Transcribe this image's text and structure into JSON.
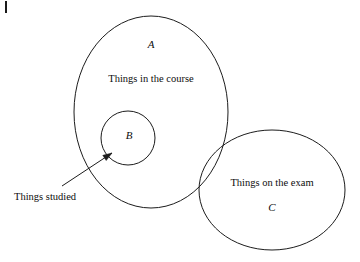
{
  "diagram": {
    "type": "euler-venn",
    "background_color": "#ffffff",
    "stroke_color": "#1c1c1c",
    "text_color": "#0d0d0d",
    "corner_mark": {
      "name": "crop-tick-mark",
      "x": 6,
      "y1": 1,
      "y2": 13
    },
    "sets": [
      {
        "key": "A",
        "symbol": "A",
        "description": "Things in the course",
        "shape": "ellipse",
        "cx": 151,
        "cy": 112,
        "rx": 77,
        "ry": 96,
        "symbol_x": 151,
        "symbol_y": 45,
        "description_x": 151,
        "description_y": 80
      },
      {
        "key": "B",
        "symbol": "B",
        "description": "",
        "shape": "circle",
        "cx": 128,
        "cy": 138,
        "rx": 27,
        "ry": 27,
        "symbol_x": 129,
        "symbol_y": 136,
        "description_x": 0,
        "description_y": 0
      },
      {
        "key": "C",
        "symbol": "C",
        "description": "Things on the exam",
        "shape": "ellipse",
        "cx": 272,
        "cy": 190,
        "rx": 73,
        "ry": 60,
        "symbol_x": 272,
        "symbol_y": 208,
        "description_x": 272,
        "description_y": 184
      }
    ],
    "annotation": {
      "label": "Things studied",
      "label_x": 14,
      "label_y": 198,
      "arrow_from_x": 62,
      "arrow_from_y": 186,
      "arrow_to_x": 112,
      "arrow_to_y": 153,
      "target_set": "B"
    }
  }
}
